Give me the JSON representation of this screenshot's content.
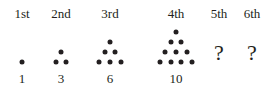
{
  "figure": {
    "width": 266,
    "height": 91,
    "background_color": "#ffffff",
    "ink_color": "#231f20"
  },
  "columns": [
    {
      "ordinal_label": "1st",
      "count_label": "1",
      "center_x": 22,
      "rows": 1,
      "type": "dots"
    },
    {
      "ordinal_label": "2nd",
      "count_label": "3",
      "center_x": 61,
      "rows": 2,
      "type": "dots"
    },
    {
      "ordinal_label": "3rd",
      "count_label": "6",
      "center_x": 110,
      "rows": 3,
      "type": "dots"
    },
    {
      "ordinal_label": "4th",
      "count_label": "10",
      "center_x": 176,
      "rows": 4,
      "type": "dots"
    },
    {
      "ordinal_label": "5th",
      "count_label": "?",
      "center_x": 219,
      "rows": 0,
      "type": "unknown"
    },
    {
      "ordinal_label": "6th",
      "count_label": "?",
      "center_x": 252,
      "rows": 0,
      "type": "unknown"
    }
  ],
  "chart_data": {
    "type": "scatter",
    "title": "",
    "subtitle": "",
    "xlabel": "",
    "ylabel": "",
    "categories": [
      "1st",
      "2nd",
      "3rd",
      "4th",
      "5th",
      "6th"
    ],
    "values": [
      1,
      3,
      6,
      10,
      null,
      null
    ],
    "value_labels": [
      "1",
      "3",
      "6",
      "10",
      "?",
      "?"
    ],
    "series": [
      {
        "name": "Triangular numbers (dot count)",
        "values": [
          1,
          3,
          6,
          10,
          null,
          null
        ]
      }
    ],
    "rows_per_figure": [
      1,
      2,
      3,
      4,
      0,
      0
    ],
    "grid": false,
    "legend": "none",
    "annotations": [
      "5th term unknown",
      "6th term unknown"
    ],
    "dot_geometry": {
      "diameter_px": 5,
      "row_spacing_px": 10,
      "column_spacing_px": 10.7,
      "baseline_y": 62
    }
  }
}
